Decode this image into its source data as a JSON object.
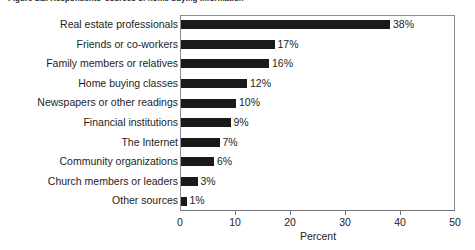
{
  "figure": {
    "caption": "Figure 3.2.  Respondents' sources of home buying information",
    "background_color": "#ffffff",
    "bar_color": "#1a1a1a",
    "frame_color": "#8b8d92",
    "text_color": "#1d1d1d"
  },
  "chart_data": {
    "type": "bar",
    "orientation": "horizontal",
    "title": "",
    "xlabel": "Percent",
    "ylabel": "",
    "xlim": [
      0,
      50
    ],
    "grid": false,
    "legend": null,
    "xticks": [
      0,
      10,
      20,
      30,
      40,
      50
    ],
    "xtick_labels": [
      "0",
      "10",
      "20",
      "30",
      "40",
      "50"
    ],
    "categories": [
      "Real estate professionals",
      "Friends or co-workers",
      "Family members or relatives",
      "Home buying classes",
      "Newspapers or other readings",
      "Financial institutions",
      "The Internet",
      "Community organizations",
      "Church members or leaders",
      "Other sources"
    ],
    "values": [
      38,
      17,
      16,
      12,
      10,
      9,
      7,
      6,
      3,
      1
    ],
    "data_labels": [
      "38%",
      "17%",
      "16%",
      "12%",
      "10%",
      "9%",
      "7%",
      "6%",
      "3%",
      "1%"
    ]
  }
}
